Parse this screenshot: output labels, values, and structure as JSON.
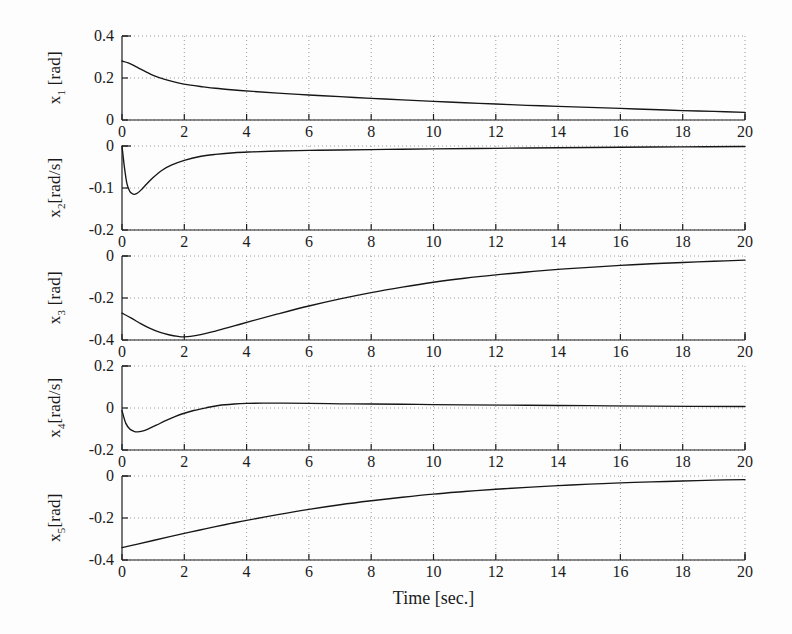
{
  "figure": {
    "background": "#fdfdfd",
    "axis_color": "#1d1d1d",
    "curve_color": "#161616",
    "grid_color": "#9a9a9a",
    "xlabel": "Time [sec.]"
  },
  "chart_data": {
    "type": "line",
    "title": "",
    "xlabel": "Time [sec.]",
    "ylabel": "",
    "grid": true,
    "legend": "none",
    "shared_x": {
      "xlim": [
        0,
        20
      ],
      "xticks": [
        0,
        2,
        4,
        6,
        8,
        10,
        12,
        14,
        16,
        18,
        20
      ],
      "xticklabels": [
        "0",
        "2",
        "4",
        "6",
        "8",
        "10",
        "12",
        "14",
        "16",
        "18",
        "20"
      ]
    },
    "panels": [
      {
        "id": "x1",
        "ylabel": "x1 [rad]",
        "ylabel_base": "x",
        "ylabel_sub": "1",
        "ylabel_unit": " [rad]",
        "ylim": [
          0,
          0.4
        ],
        "yticks": [
          0,
          0.2,
          0.4
        ],
        "yticklabels": [
          "0",
          "0.2",
          "0.4"
        ],
        "x": [
          0,
          0.2,
          0.4,
          0.6,
          0.8,
          1.0,
          1.4,
          1.8,
          2.2,
          2.6,
          3.0,
          3.6,
          4.2,
          5.0,
          6.0,
          7.0,
          8.0,
          9.0,
          10.0,
          11.0,
          12.0,
          13.0,
          14.0,
          15.0,
          16.0,
          17.0,
          18.0,
          19.0,
          20.0
        ],
        "y": [
          0.281,
          0.272,
          0.258,
          0.242,
          0.227,
          0.213,
          0.192,
          0.177,
          0.166,
          0.158,
          0.151,
          0.143,
          0.136,
          0.128,
          0.119,
          0.111,
          0.103,
          0.096,
          0.089,
          0.082,
          0.076,
          0.07,
          0.065,
          0.06,
          0.055,
          0.05,
          0.045,
          0.041,
          0.036
        ]
      },
      {
        "id": "x2",
        "ylabel": "x2[rad/s]",
        "ylabel_base": "x",
        "ylabel_sub": "2",
        "ylabel_unit": "[rad/s]",
        "ylim": [
          -0.2,
          0
        ],
        "yticks": [
          0,
          -0.1,
          -0.2
        ],
        "yticklabels": [
          "0",
          "-0.1",
          "-0.2"
        ],
        "x": [
          0,
          0.08,
          0.16,
          0.25,
          0.32,
          0.4,
          0.5,
          0.62,
          0.8,
          1.0,
          1.3,
          1.6,
          2.0,
          2.5,
          3.0,
          3.6,
          4.2,
          5.0,
          6.0,
          7.0,
          8.5,
          10.0,
          12.0,
          14.0,
          16.0,
          18.0,
          20.0
        ],
        "y": [
          0.0,
          -0.052,
          -0.09,
          -0.108,
          -0.113,
          -0.115,
          -0.112,
          -0.104,
          -0.09,
          -0.075,
          -0.057,
          -0.045,
          -0.034,
          -0.025,
          -0.02,
          -0.016,
          -0.014,
          -0.012,
          -0.0105,
          -0.0095,
          -0.008,
          -0.007,
          -0.0055,
          -0.0042,
          -0.003,
          -0.002,
          -0.0012
        ]
      },
      {
        "id": "x3",
        "ylabel": "x3 [rad]",
        "ylabel_base": "x",
        "ylabel_sub": "3",
        "ylabel_unit": " [rad]",
        "ylim": [
          -0.4,
          0
        ],
        "yticks": [
          0,
          -0.2,
          -0.4
        ],
        "yticklabels": [
          "0",
          "-0.2",
          "-0.4"
        ],
        "x": [
          0,
          0.3,
          0.6,
          0.9,
          1.2,
          1.5,
          1.8,
          2.0,
          2.4,
          3.0,
          3.6,
          4.2,
          5.0,
          6.0,
          7.0,
          8.0,
          9.0,
          10.0,
          11.0,
          12.0,
          13.0,
          14.0,
          15.0,
          16.0,
          17.0,
          18.0,
          19.0,
          20.0
        ],
        "y": [
          -0.272,
          -0.296,
          -0.322,
          -0.345,
          -0.363,
          -0.375,
          -0.383,
          -0.385,
          -0.378,
          -0.358,
          -0.333,
          -0.308,
          -0.276,
          -0.238,
          -0.204,
          -0.174,
          -0.148,
          -0.125,
          -0.106,
          -0.09,
          -0.076,
          -0.064,
          -0.054,
          -0.045,
          -0.037,
          -0.031,
          -0.025,
          -0.02
        ]
      },
      {
        "id": "x4",
        "ylabel": "x4[rad/s]",
        "ylabel_base": "x",
        "ylabel_sub": "4",
        "ylabel_unit": "[rad/s]",
        "ylim": [
          -0.2,
          0.2
        ],
        "yticks": [
          0.2,
          0,
          -0.2
        ],
        "yticklabels": [
          "0.2",
          "0",
          "-0.2"
        ],
        "x": [
          0,
          0.12,
          0.25,
          0.38,
          0.5,
          0.65,
          0.85,
          1.1,
          1.4,
          1.7,
          2.0,
          2.3,
          2.7,
          3.1,
          3.6,
          4.0,
          4.6,
          5.2,
          6.0,
          7.0,
          8.0,
          9.5,
          11.0,
          13.0,
          15.0,
          17.0,
          20.0
        ],
        "y": [
          -0.012,
          -0.072,
          -0.1,
          -0.111,
          -0.114,
          -0.11,
          -0.099,
          -0.082,
          -0.06,
          -0.041,
          -0.025,
          -0.012,
          0.001,
          0.012,
          0.019,
          0.022,
          0.023,
          0.023,
          0.022,
          0.02,
          0.019,
          0.017,
          0.015,
          0.013,
          0.011,
          0.009,
          0.007
        ]
      },
      {
        "id": "x5",
        "ylabel": "x5[rad]",
        "ylabel_base": "x",
        "ylabel_sub": "5",
        "ylabel_unit": "[rad]",
        "ylim": [
          -0.4,
          0
        ],
        "yticks": [
          0,
          -0.2,
          -0.4
        ],
        "yticklabels": [
          "0",
          "-0.2",
          "-0.4"
        ],
        "x": [
          0,
          0.5,
          1.0,
          1.5,
          2.0,
          2.5,
          3.0,
          3.5,
          4.0,
          5.0,
          6.0,
          7.0,
          8.0,
          9.0,
          10.0,
          11.0,
          12.0,
          13.0,
          14.0,
          15.0,
          16.0,
          17.0,
          18.0,
          19.0,
          20.0
        ],
        "y": [
          -0.341,
          -0.324,
          -0.307,
          -0.29,
          -0.273,
          -0.257,
          -0.241,
          -0.226,
          -0.211,
          -0.184,
          -0.159,
          -0.137,
          -0.118,
          -0.101,
          -0.086,
          -0.074,
          -0.063,
          -0.054,
          -0.046,
          -0.039,
          -0.033,
          -0.028,
          -0.024,
          -0.02,
          -0.017
        ]
      }
    ]
  }
}
